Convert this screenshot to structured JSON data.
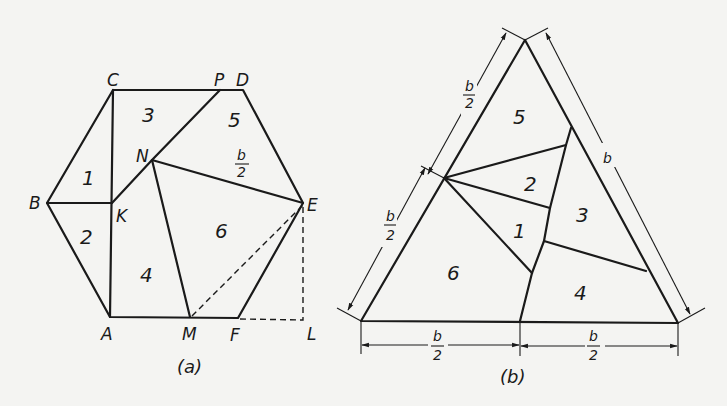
{
  "figure_a": {
    "caption": "(a)",
    "vertices": {
      "C": "C",
      "P": "P",
      "D": "D",
      "B": "B",
      "K": "K",
      "N": "N",
      "E": "E",
      "A": "A",
      "M": "M",
      "F": "F",
      "L": "L"
    },
    "pieces": [
      "1",
      "2",
      "3",
      "4",
      "5",
      "6"
    ],
    "dimension": {
      "num": "b",
      "den": "2"
    }
  },
  "figure_b": {
    "caption": "(b)",
    "pieces": [
      "1",
      "2",
      "3",
      "4",
      "5",
      "6"
    ],
    "dimensions": {
      "left_upper": {
        "num": "b",
        "den": "2"
      },
      "left_lower": {
        "num": "b",
        "den": "2"
      },
      "right": "b",
      "bottom_left": {
        "num": "b",
        "den": "2"
      },
      "bottom_right": {
        "num": "b",
        "den": "2"
      }
    }
  },
  "colors": {
    "ink": "#1a1a1a",
    "paper": "#f4f4f2"
  }
}
